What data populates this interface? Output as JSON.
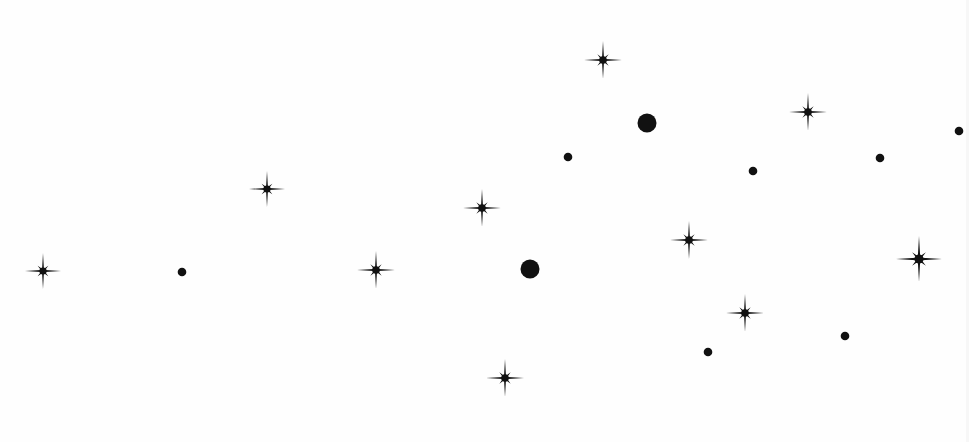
{
  "scene": {
    "width": 969,
    "height": 442,
    "background": "#fefefe",
    "ink": "#111111",
    "stars": [
      {
        "x": 43,
        "y": 271,
        "r": 18
      },
      {
        "x": 267,
        "y": 189,
        "r": 18
      },
      {
        "x": 376,
        "y": 270,
        "r": 19
      },
      {
        "x": 482,
        "y": 208,
        "r": 19
      },
      {
        "x": 603,
        "y": 60,
        "r": 19
      },
      {
        "x": 689,
        "y": 240,
        "r": 19
      },
      {
        "x": 808,
        "y": 112,
        "r": 19
      },
      {
        "x": 919,
        "y": 259,
        "r": 23
      },
      {
        "x": 745,
        "y": 313,
        "r": 19
      },
      {
        "x": 505,
        "y": 378,
        "r": 19
      }
    ],
    "dots": [
      {
        "x": 647,
        "y": 123,
        "r": 9.5
      },
      {
        "x": 530,
        "y": 269,
        "r": 9.5
      },
      {
        "x": 568,
        "y": 157,
        "r": 4.3
      },
      {
        "x": 753,
        "y": 171,
        "r": 4.3
      },
      {
        "x": 880,
        "y": 158,
        "r": 4.3
      },
      {
        "x": 959,
        "y": 131,
        "r": 4.3
      },
      {
        "x": 182,
        "y": 272,
        "r": 4.3
      },
      {
        "x": 708,
        "y": 352,
        "r": 4.3
      },
      {
        "x": 845,
        "y": 336,
        "r": 4.3
      }
    ]
  }
}
